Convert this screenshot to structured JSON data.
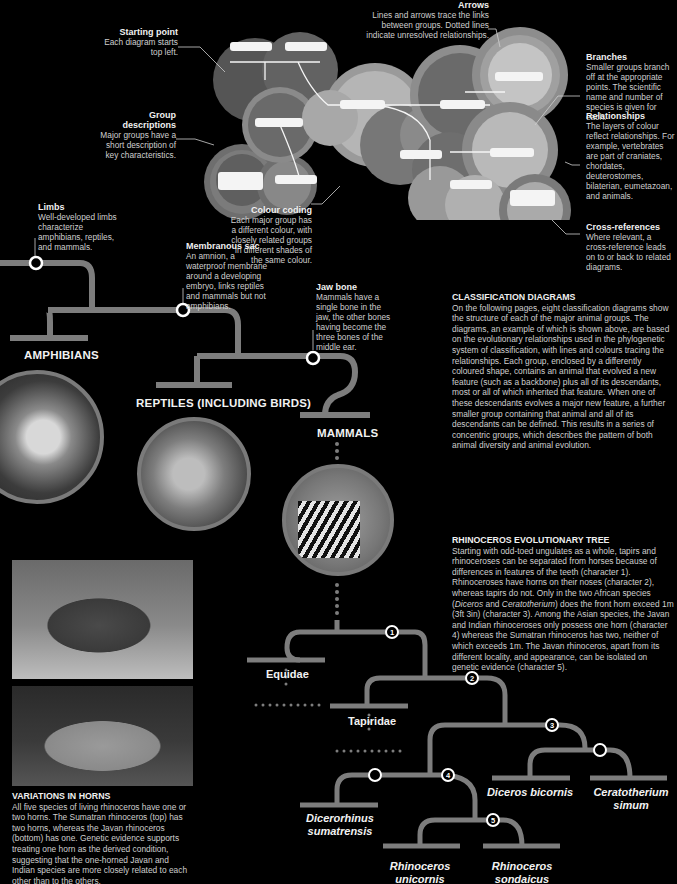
{
  "annotations": {
    "starting_point": {
      "title": "Starting point",
      "text": "Each diagram starts top left."
    },
    "group_descriptions": {
      "title": "Group descriptions",
      "text": "Major groups have a short description of key characteristics."
    },
    "arrows": {
      "title": "Arrows",
      "text": "Lines and arrows trace the links between groups. Dotted lines indicate unresolved relationships."
    },
    "branches": {
      "title": "Branches",
      "text": "Smaller groups branch off at the appropriate points. The scientific name and number of species is given for each."
    },
    "relationships": {
      "title": "Relationships",
      "text": "The layers of colour reflect relationships. For example, vertebrates are part of craniates, chordates, deuterostomes, bilaterian, eumetazoan, and animals."
    },
    "colour_coding": {
      "title": "Colour coding",
      "text": "Each major group has a different colour, with closely related groups in different shades of the same colour."
    },
    "cross_references": {
      "title": "Cross-references",
      "text": "Where relevant, a cross-reference leads on to or back to related diagrams."
    },
    "limbs": {
      "title": "Limbs",
      "text": "Well-developed limbs characterize amphibians, reptiles, and mammals."
    },
    "membranous_sac": {
      "title": "Membranous sac",
      "text": "An amnion, a waterproof membrane around a developing embryo, links reptiles and mammals but not amphibians."
    },
    "jaw_bone": {
      "title": "Jaw bone",
      "text": "Mammals have a single bone in the jaw, the other bones having become the three bones of the middle ear."
    }
  },
  "vertebrate_tree": {
    "groups": [
      "AMPHIBIANS",
      "REPTILES (INCLUDING BIRDS)",
      "MAMMALS"
    ],
    "photos": [
      "frog-photo",
      "lizard-photo",
      "zebra-photo"
    ]
  },
  "classification": {
    "title": "CLASSIFICATION DIAGRAMS",
    "text": "On the following pages, eight classification diagrams show the structure of each of the major animal groups. The diagrams, an example of which is shown above, are based on the evolutionary relationships used in the phylogenetic system of classification, with lines and colours tracing the relationships. Each group, enclosed by a differently coloured shape, contains an animal that evolved a new feature (such as a backbone) plus all of its descendants, most or all of which inherited that feature. When one of these descendants evolves a major new feature, a further smaller group containing that animal and all of its descendants can be defined. This results in a series of concentric groups, which describes the pattern of both animal diversity and animal evolution."
  },
  "rhino_tree": {
    "title": "RHINOCEROS EVOLUTIONARY TREE",
    "text_1": "Starting with odd-toed ungulates as a whole, tapirs and rhinoceroses can be separated from horses because of differences in features of the teeth (character 1). Rhinoceroses have horns on their noses (character 2), whereas tapirs do not. Only in the two African species (",
    "genus_a": "Diceros",
    "text_and": " and ",
    "genus_b": "Ceratotherium",
    "text_2": ") does the front horn exceed 1m (3ft 3in) (character 3). Among the Asian species, the Javan and Indian rhinoceroses only possess one horn (character 4) whereas the Sumatran rhinoceros has two, neither of which exceeds 1m. The Javan rhinoceros, apart from its different locality, and appearance, can be isolated on genetic evidence (character 5).",
    "families": [
      "Equidae",
      "Tapiridae"
    ],
    "species": [
      {
        "line1": "Dicerorhinus",
        "line2": "sumatrensis"
      },
      {
        "line1": "Rhinoceros",
        "line2": "unicornis"
      },
      {
        "line1": "Rhinoceros",
        "line2": "sondaicus"
      },
      {
        "line1": "Diceros bicornis",
        "line2": ""
      },
      {
        "line1": "Ceratotherium",
        "line2": "simum"
      }
    ],
    "characters": [
      "1",
      "2",
      "3",
      "4",
      "5"
    ]
  },
  "variations": {
    "title": "VARIATIONS IN HORNS",
    "text": "All five species of living rhinoceros have one or two horns. The Sumatran rhinoceros (top) has two horns, whereas the Javan rhinoceros (bottom) has one. Genetic evidence supports treating one horn as the derived condition, suggesting that the one-horned Javan and Indian species are more closely related to each other than to the others.",
    "photos": [
      "sumatran-rhino-photo",
      "javan-rhino-photo"
    ]
  },
  "colors": {
    "background": "#000000",
    "branch": "#7d7d7d",
    "text": "#d0d0d0",
    "heading": "#f2f2f2",
    "node_fill": "#000000",
    "node_stroke": "#ffffff"
  }
}
